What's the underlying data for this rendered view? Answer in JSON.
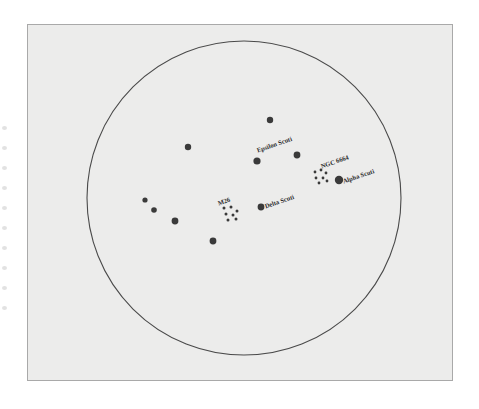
{
  "figure": {
    "name": "scutum-constellation-star-chart",
    "background_color": "#ffffff",
    "panel_color": "#ececeb",
    "panel_border_color": "#a9a9a9",
    "ink_color": "#3a3a3a",
    "label_color": "#2b2b2b"
  },
  "chart_data": {
    "type": "scatter",
    "title": "",
    "xlabel": "",
    "ylabel": "",
    "grid": false,
    "legend": "none",
    "projection": "circular sky field",
    "field_circle": {
      "cx": 244,
      "cy": 198,
      "r": 157,
      "stroke": "#4a4a4a"
    },
    "labels": [
      {
        "name": "Epsilon Scuti",
        "x": 258,
        "y": 150,
        "rotation": -19
      },
      {
        "name": "NGC 6664",
        "x": 322,
        "y": 166,
        "rotation": -19
      },
      {
        "name": "Alpha Scuti",
        "x": 344,
        "y": 181,
        "rotation": -19
      },
      {
        "name": "Delta Scuti",
        "x": 266,
        "y": 206,
        "rotation": -19
      },
      {
        "name": "M26",
        "x": 219,
        "y": 203,
        "rotation": -19
      }
    ],
    "stars": [
      {
        "id": "star-1",
        "x": 270,
        "y": 120,
        "r": 3.2,
        "label": ""
      },
      {
        "id": "star-2",
        "x": 188,
        "y": 147,
        "r": 3.2,
        "label": ""
      },
      {
        "id": "star-epsilon-scuti",
        "x": 257,
        "y": 161,
        "r": 3.6,
        "label": "Epsilon Scuti"
      },
      {
        "id": "star-3",
        "x": 297,
        "y": 155,
        "r": 3.4,
        "label": ""
      },
      {
        "id": "star-alpha-scuti",
        "x": 339,
        "y": 180,
        "r": 4.2,
        "label": "Alpha Scuti"
      },
      {
        "id": "star-delta-scuti",
        "x": 261,
        "y": 207,
        "r": 3.4,
        "label": "Delta Scuti"
      },
      {
        "id": "star-4",
        "x": 145,
        "y": 200,
        "r": 2.6,
        "label": ""
      },
      {
        "id": "star-5",
        "x": 154,
        "y": 210,
        "r": 2.8,
        "label": ""
      },
      {
        "id": "star-6",
        "x": 175,
        "y": 221,
        "r": 3.4,
        "label": ""
      },
      {
        "id": "star-7",
        "x": 213,
        "y": 241,
        "r": 3.4,
        "label": ""
      }
    ],
    "clusters": [
      {
        "id": "cluster-m26",
        "label": "M26",
        "cx": 230,
        "cy": 214,
        "members": [
          {
            "x": 224,
            "y": 208,
            "r": 1.5
          },
          {
            "x": 231,
            "y": 207,
            "r": 1.5
          },
          {
            "x": 237,
            "y": 211,
            "r": 1.5
          },
          {
            "x": 226,
            "y": 214,
            "r": 1.5
          },
          {
            "x": 233,
            "y": 215,
            "r": 1.5
          },
          {
            "x": 228,
            "y": 220,
            "r": 1.5
          },
          {
            "x": 236,
            "y": 219,
            "r": 1.5
          }
        ]
      },
      {
        "id": "cluster-ngc-6664",
        "label": "NGC 6664",
        "cx": 320,
        "cy": 176,
        "members": [
          {
            "x": 315,
            "y": 172,
            "r": 1.4
          },
          {
            "x": 321,
            "y": 170,
            "r": 1.4
          },
          {
            "x": 326,
            "y": 173,
            "r": 1.4
          },
          {
            "x": 316,
            "y": 178,
            "r": 1.4
          },
          {
            "x": 323,
            "y": 178,
            "r": 1.4
          },
          {
            "x": 319,
            "y": 183,
            "r": 1.4
          },
          {
            "x": 327,
            "y": 181,
            "r": 1.4
          }
        ]
      }
    ]
  },
  "edge_artifacts": [
    {
      "y": 126
    },
    {
      "y": 146
    },
    {
      "y": 166
    },
    {
      "y": 186
    },
    {
      "y": 206
    },
    {
      "y": 226
    },
    {
      "y": 246
    },
    {
      "y": 266
    },
    {
      "y": 286
    },
    {
      "y": 306
    }
  ]
}
